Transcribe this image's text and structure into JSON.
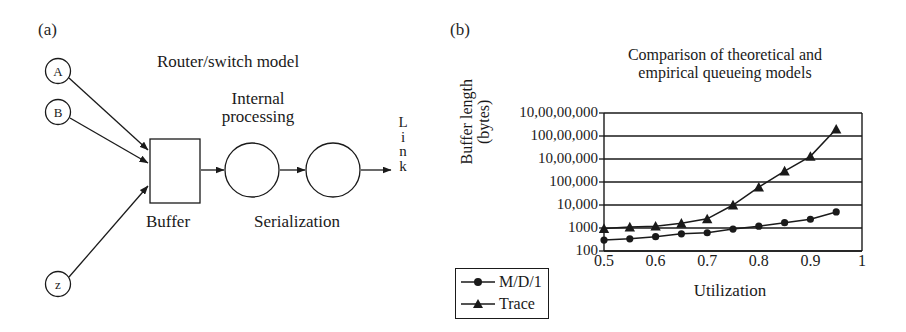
{
  "figure": {
    "panel_a_label": "(a)",
    "panel_b_label": "(b)"
  },
  "diagram": {
    "title": "Router/switch model",
    "internal_processing": "Internal\nprocessing",
    "internal_processing_line1": "Internal",
    "internal_processing_line2": "processing",
    "buffer_label": "Buffer",
    "serialization_label": "Serialization",
    "link_label": "L\ni\nn\nk",
    "link_letters": [
      "L",
      "i",
      "n",
      "k"
    ],
    "nodes": [
      {
        "id": "A",
        "label": "A"
      },
      {
        "id": "B",
        "label": "B"
      },
      {
        "id": "z",
        "label": "z"
      }
    ],
    "stroke_color": "#1a1a1a"
  },
  "chart_data": {
    "type": "line",
    "title": "Comparison of theoretical and empirical queueing models",
    "title_line1": "Comparison of theoretical and",
    "title_line2": "empirical queueing models",
    "xlabel": "Utilization",
    "ylabel": "Buffer length (bytes)",
    "ylabel_line1": "Buffer length",
    "ylabel_line2": "(bytes)",
    "yscale": "log",
    "ylim": [
      100,
      100000000
    ],
    "xlim": [
      0.5,
      1.0
    ],
    "grid": "horizontal",
    "legend_position": "below-left",
    "ytick_labels": [
      "10,00,00,000",
      "100,00,000",
      "10,00,000",
      "100,000",
      "10,000",
      "1000",
      "100"
    ],
    "ytick_values": [
      100000000,
      10000000,
      1000000,
      100000,
      10000,
      1000,
      100
    ],
    "xtick_labels": [
      "0.5",
      "0.6",
      "0.7",
      "0.8",
      "0.9",
      "1"
    ],
    "xtick_values": [
      0.5,
      0.6,
      0.7,
      0.8,
      0.9,
      1.0
    ],
    "x": [
      0.5,
      0.55,
      0.6,
      0.65,
      0.7,
      0.75,
      0.8,
      0.85,
      0.9,
      0.95
    ],
    "series": [
      {
        "name": "M/D/1",
        "marker": "circle",
        "color": "#1a1a1a",
        "values": [
          300,
          340,
          420,
          560,
          620,
          900,
          1200,
          1700,
          2400,
          5000
        ]
      },
      {
        "name": "Trace",
        "marker": "triangle",
        "color": "#1a1a1a",
        "values": [
          950,
          1100,
          1200,
          1600,
          2500,
          10000,
          60000,
          300000,
          1300000,
          20000000
        ]
      }
    ]
  }
}
